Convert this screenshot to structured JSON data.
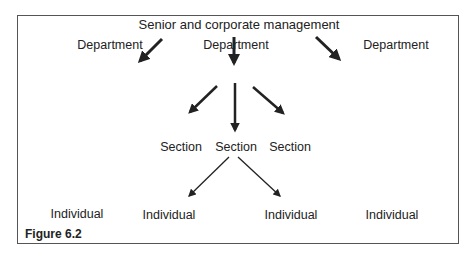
{
  "diagram": {
    "root": "Senior and corporate management",
    "departments": [
      "Department",
      "Department",
      "Department"
    ],
    "sections": [
      "Section",
      "Section",
      "Section"
    ],
    "individuals": [
      "Individual",
      "Individual",
      "Individual",
      "Individual"
    ],
    "caption": "Figure 6.2"
  }
}
